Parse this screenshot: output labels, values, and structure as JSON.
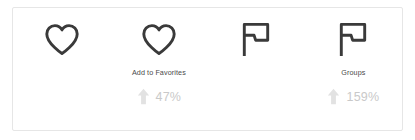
{
  "card": {
    "background_color": "#ffffff",
    "border_color": "#e6e6e6"
  },
  "colors": {
    "icon": "#3a3a3a",
    "label_text": "#4a4a4a",
    "metric_text": "#c9c9c9",
    "trend_arrow": "#e2e2e2"
  },
  "metrics": [
    {
      "icon": "heart-icon",
      "label": "",
      "trend_icon": "",
      "value": ""
    },
    {
      "icon": "heart-icon",
      "label": "Add to Favorites",
      "trend_icon": "arrow-up-icon",
      "value": "47%"
    },
    {
      "icon": "flag-icon",
      "label": "",
      "trend_icon": "",
      "value": ""
    },
    {
      "icon": "flag-icon",
      "label": "Groups",
      "trend_icon": "arrow-up-icon",
      "value": "159%"
    }
  ]
}
